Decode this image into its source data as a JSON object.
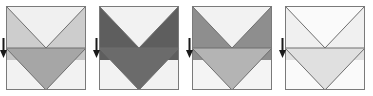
{
  "figure": {
    "type": "diagram",
    "title": "",
    "width": 373,
    "height": 96,
    "background": "#ffffff",
    "panel_count": 4
  },
  "geometry": {
    "square": {
      "x": 6,
      "y": 6,
      "width": 80,
      "height": 84,
      "outline_color": "#7a7a7a",
      "outline_width": 1
    },
    "midline_y": 48,
    "apex_x": 46,
    "crease_color": "#6e6e6e",
    "arrow": {
      "x": 2,
      "y_top": 38,
      "y_bottom": 58,
      "color": "#1a1a1a",
      "direction": "down",
      "shaft_width": 2,
      "head_width": 7,
      "head_height": 8
    }
  },
  "panels": [
    {
      "index": 1,
      "name": "panel-1",
      "label": "",
      "regions": {
        "upper_left_wing": "#cdcdcd",
        "upper_center_notch": "#f0f0f0",
        "upper_right_wing": "#cdcdcd",
        "lower_band_left": "#c6c6c6",
        "lower_v_triangle": "#a6a6a6",
        "lower_outer": "#f2f2f2"
      }
    },
    {
      "index": 2,
      "name": "panel-2",
      "label": "",
      "regions": {
        "upper_left_wing": "#5e5e5e",
        "upper_center_notch": "#f2f2f2",
        "upper_right_wing": "#5e5e5e",
        "lower_band_left": "#5e5e5e",
        "lower_v_triangle": "#6b6b6b",
        "lower_outer": "#f2f2f2"
      }
    },
    {
      "index": 3,
      "name": "panel-3",
      "label": "",
      "regions": {
        "upper_left_wing": "#8e8e8e",
        "upper_center_notch": "#f2f2f2",
        "upper_right_wing": "#8e8e8e",
        "lower_band_left": "#8e8e8e",
        "lower_v_triangle": "#b4b4b4",
        "lower_outer": "#f4f4f4"
      }
    },
    {
      "index": 4,
      "name": "panel-4",
      "label": "",
      "regions": {
        "upper_left_wing": "#f0f0f0",
        "upper_center_notch": "#fafafa",
        "upper_right_wing": "#f0f0f0",
        "lower_band_left": "#e2e2e2",
        "lower_v_triangle": "#e0e0e0",
        "lower_outer": "#fafafa"
      }
    }
  ],
  "panel_positions": [
    0,
    93,
    186,
    279
  ]
}
